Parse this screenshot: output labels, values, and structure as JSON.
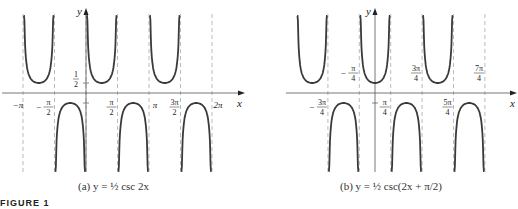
{
  "figure": {
    "label": "FIGURE 1",
    "panels": [
      {
        "id": "a",
        "caption": "(a)  y = ½ csc 2x",
        "equation": "y = (1/2) csc 2x",
        "axis_labels": {
          "x": "x",
          "y": "y"
        },
        "x_tick_labels": [
          "−π",
          "−π/2",
          "π/2",
          "π",
          "3π/2",
          "2π"
        ],
        "y_tick_labels": [
          "1/2"
        ],
        "asymptotes": [
          "−π",
          "−π/2",
          "0",
          "π/2",
          "π",
          "3π/2",
          "2π"
        ]
      },
      {
        "id": "b",
        "caption": "(b)  y = ½ csc(2x + π/2)",
        "equation": "y = (1/2) csc(2x + π/2)",
        "axis_labels": {
          "x": "x",
          "y": "y"
        },
        "x_tick_labels": [
          "−3π/4",
          "−π/4",
          "π/4",
          "3π/4",
          "5π/4",
          "7π/4"
        ],
        "asymptotes": [
          "−3π/4",
          "−π/4",
          "π/4",
          "3π/4",
          "5π/4",
          "7π/4"
        ]
      }
    ]
  },
  "chart_data": [
    {
      "type": "line",
      "title": "(a) y = ½ csc 2x",
      "xlabel": "x",
      "ylabel": "y",
      "function": "y = 0.5 * csc(2x)",
      "xlim": [
        -3.4,
        7.2
      ],
      "ylim": [
        -2.5,
        2.5
      ],
      "x_ticks": [
        {
          "value": -3.1416,
          "label": "−π"
        },
        {
          "value": -1.5708,
          "label": "−π/2"
        },
        {
          "value": 1.5708,
          "label": "π/2"
        },
        {
          "value": 3.1416,
          "label": "π"
        },
        {
          "value": 4.7124,
          "label": "3π/2"
        },
        {
          "value": 6.2832,
          "label": "2π"
        }
      ],
      "y_ticks": [
        {
          "value": 0.5,
          "label": "1/2"
        },
        {
          "value": -0.5,
          "label": ""
        }
      ],
      "vertical_asymptotes": [
        -3.1416,
        -1.5708,
        0,
        1.5708,
        3.1416,
        4.7124,
        6.2832
      ],
      "branches": [
        {
          "interval": [
            -3.1416,
            -1.5708
          ],
          "direction": "up",
          "vertex": [
            -2.3562,
            0.5
          ]
        },
        {
          "interval": [
            -1.5708,
            0
          ],
          "direction": "down",
          "vertex": [
            -0.7854,
            -0.5
          ]
        },
        {
          "interval": [
            0,
            1.5708
          ],
          "direction": "up",
          "vertex": [
            0.7854,
            0.5
          ]
        },
        {
          "interval": [
            1.5708,
            3.1416
          ],
          "direction": "down",
          "vertex": [
            2.3562,
            -0.5
          ]
        },
        {
          "interval": [
            3.1416,
            4.7124
          ],
          "direction": "up",
          "vertex": [
            3.927,
            0.5
          ]
        },
        {
          "interval": [
            4.7124,
            6.2832
          ],
          "direction": "down",
          "vertex": [
            5.4978,
            -0.5
          ]
        }
      ],
      "grid": false
    },
    {
      "type": "line",
      "title": "(b) y = ½ csc(2x + π/2)",
      "xlabel": "x",
      "ylabel": "y",
      "function": "y = 0.5 * csc(2x + pi/2)",
      "xlim": [
        -2.9,
        5.9
      ],
      "ylim": [
        -2.5,
        2.5
      ],
      "x_ticks": [
        {
          "value": -2.3562,
          "label": "−3π/4"
        },
        {
          "value": -0.7854,
          "label": "−π/4"
        },
        {
          "value": 0.7854,
          "label": "π/4"
        },
        {
          "value": 2.3562,
          "label": "3π/4"
        },
        {
          "value": 3.927,
          "label": "5π/4"
        },
        {
          "value": 5.4978,
          "label": "7π/4"
        }
      ],
      "vertical_asymptotes": [
        -2.3562,
        -0.7854,
        0.7854,
        2.3562,
        3.927,
        5.4978
      ],
      "branches": [
        {
          "interval": [
            -3.927,
            -2.3562
          ],
          "direction": "up",
          "vertex": [
            -3.1416,
            0.5
          ]
        },
        {
          "interval": [
            -2.3562,
            -0.7854
          ],
          "direction": "down",
          "vertex": [
            -1.5708,
            -0.5
          ]
        },
        {
          "interval": [
            -0.7854,
            0.7854
          ],
          "direction": "up",
          "vertex": [
            0,
            0.5
          ]
        },
        {
          "interval": [
            0.7854,
            2.3562
          ],
          "direction": "down",
          "vertex": [
            1.5708,
            -0.5
          ]
        },
        {
          "interval": [
            2.3562,
            3.927
          ],
          "direction": "up",
          "vertex": [
            3.1416,
            0.5
          ]
        },
        {
          "interval": [
            3.927,
            5.4978
          ],
          "direction": "down",
          "vertex": [
            4.7124,
            -0.5
          ]
        }
      ],
      "grid": false
    }
  ],
  "colors": {
    "curve": "#3a3a3a",
    "axis": "#555555",
    "asymptote": "#aaaaaa",
    "text": "#222222"
  }
}
